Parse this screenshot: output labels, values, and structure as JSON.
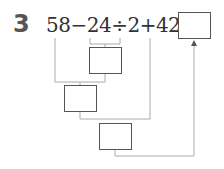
{
  "problem": {
    "number": "3",
    "expression": "58−24÷2+42=",
    "tokens": [
      "58",
      "−",
      "24",
      "÷",
      "2",
      "+",
      "42",
      "="
    ]
  },
  "boxes": [
    {
      "id": "step1-box",
      "represents": "24÷2",
      "value": ""
    },
    {
      "id": "step2-box",
      "represents": "58−(24÷2)",
      "value": ""
    },
    {
      "id": "step3-box",
      "represents": "(58−24÷2)+42",
      "value": ""
    },
    {
      "id": "answer-box",
      "represents": "final answer",
      "value": ""
    }
  ],
  "colors": {
    "line": "#aaaaaa",
    "box_border": "#555555",
    "text": "#333333"
  }
}
